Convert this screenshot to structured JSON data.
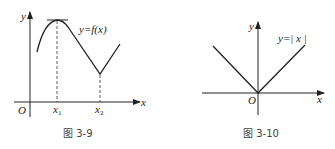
{
  "figures": [
    {
      "id": "fig-3-9",
      "caption": "图 3-9",
      "axis_x_label": "x",
      "axis_y_label": "y",
      "origin_label": "O",
      "function_label": "y=f(x)",
      "tick_labels": [
        {
          "base": "x",
          "sub": "1"
        },
        {
          "base": "x",
          "sub": "2"
        }
      ],
      "description": "Curve rises to a local maximum at x1 (horizontal tangent), decreases linearly to a corner minimum at x2, then increases linearly."
    },
    {
      "id": "fig-3-10",
      "caption": "图 3-10",
      "axis_x_label": "x",
      "axis_y_label": "y",
      "origin_label": "O",
      "function_label": "y=| x |",
      "description": "V-shaped graph of the absolute value function with vertex at the origin."
    }
  ],
  "colors": {
    "stroke": "#222222",
    "dash": "#333333",
    "caption": "#444444"
  }
}
